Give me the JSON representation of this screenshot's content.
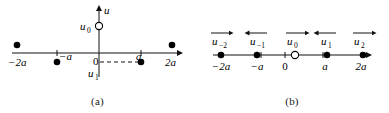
{
  "figure": {
    "panels": [
      {
        "id": "a",
        "caption": "(a)",
        "axes": {
          "x_axis_name": "x-axis",
          "y_axis_label": "u",
          "origin_label": "0"
        },
        "tick_labels": [
          "−2a",
          "−a",
          "0",
          "a",
          "2a"
        ],
        "vertical_labels": [
          {
            "name": "u0",
            "text": "u",
            "sub": "0"
          },
          {
            "name": "u1",
            "text": "u",
            "sub": "1"
          }
        ],
        "markers": [
          {
            "name": "point-minus-2a",
            "label": "−2a",
            "x": -2,
            "y": 1,
            "style": "filled"
          },
          {
            "name": "point-minus-a",
            "label": "−a",
            "x": -1,
            "y": -1,
            "style": "filled"
          },
          {
            "name": "point-u0",
            "label": "u0",
            "x": 0,
            "y": 1,
            "style": "open"
          },
          {
            "name": "point-a",
            "label": "a",
            "x": 1,
            "y": -1,
            "style": "filled"
          },
          {
            "name": "point-2a",
            "label": "2a",
            "x": 2,
            "y": 1,
            "style": "filled"
          }
        ],
        "dashed_guide": {
          "name": "dashed-guide-u1",
          "from_x": 0,
          "to_x": 1,
          "y": -1
        }
      },
      {
        "id": "b",
        "caption": "(b)",
        "axes": {
          "x_axis_name": "x-axis",
          "origin_label": "0"
        },
        "tick_labels": [
          "−2a",
          "−a",
          "0",
          "a",
          "2a"
        ],
        "markers": [
          {
            "name": "point-minus-2a",
            "label": "−2a",
            "x": -2,
            "style": "filled"
          },
          {
            "name": "point-minus-a",
            "label": "−a",
            "x": -1,
            "style": "filled"
          },
          {
            "name": "point-zero",
            "label": "0",
            "x": 0,
            "style": "open"
          },
          {
            "name": "point-a",
            "label": "a",
            "x": 1,
            "style": "filled"
          },
          {
            "name": "point-2a",
            "label": "2a",
            "x": 2,
            "style": "filled"
          }
        ],
        "vectors": [
          {
            "name": "vector-u-minus-2",
            "text": "u",
            "sub": "−2",
            "x": -2,
            "direction": "right"
          },
          {
            "name": "vector-u-minus-1",
            "text": "u",
            "sub": "−1",
            "x": -1,
            "direction": "left"
          },
          {
            "name": "vector-u-0",
            "text": "u",
            "sub": "0",
            "x": 0,
            "direction": "right"
          },
          {
            "name": "vector-u-1",
            "text": "u",
            "sub": "1",
            "x": 1,
            "direction": "left"
          },
          {
            "name": "vector-u-2",
            "text": "u",
            "sub": "2",
            "x": 2,
            "direction": "right"
          }
        ]
      }
    ]
  },
  "colors": {
    "ink": "#000000",
    "background": "#ffffff",
    "axis": "#1a1a1a"
  }
}
